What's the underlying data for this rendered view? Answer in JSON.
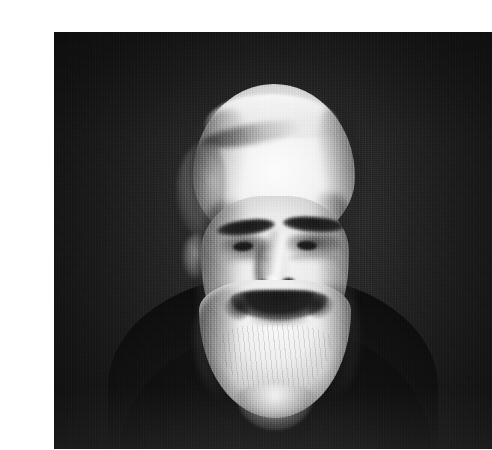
{
  "document": {
    "type": "scanned-photograph",
    "medium": "black-and-white halftone print",
    "page_background": "#ffffff",
    "alt_text": "Black and white portrait photograph of an elderly man with a high bald forehead, thick dark eyebrows, a drooping dark moustache and a full white beard, wearing a dark coat against a dark studio backdrop."
  },
  "photograph": {
    "caption": "",
    "frame": {
      "x": 14,
      "y": 16,
      "width": 438,
      "height": 417
    },
    "palette": {
      "backdrop_dark": "#272727",
      "backdrop_mid": "#3a3a3a",
      "coat_black": "#131313",
      "skin_highlight": "#f7f7f7",
      "beard_white": "#fbfbfb",
      "feature_shadow": "#1c1c1c",
      "page_white": "#ffffff"
    },
    "subject": {
      "orientation": "three-quarter facing viewer, head slightly turned to subject's right",
      "features": [
        "high receding hairline",
        "thin white hair combed across crown",
        "heavy dark eyebrows",
        "deep-set eyes",
        "broad nose",
        "drooping dark moustache",
        "full white beard",
        "dark buttoned coat"
      ]
    },
    "regions": {
      "backdrop": "dark studio backdrop",
      "head": "head and face",
      "beard": "full white beard",
      "torso": "dark coat and shoulders"
    }
  }
}
